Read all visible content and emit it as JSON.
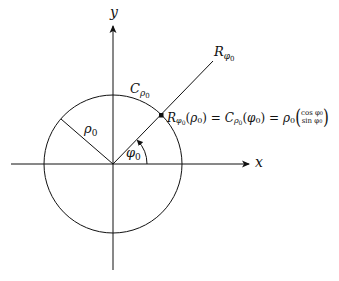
{
  "diagram": {
    "axes": {
      "x_label": "x",
      "y_label": "y"
    },
    "labels": {
      "ray": {
        "main": "R",
        "sub": "φ",
        "subsub": "0"
      },
      "circle": {
        "main": "C",
        "sub": "ρ",
        "subsub": "0"
      },
      "radius": {
        "main": "ρ",
        "sub": "0"
      },
      "angle": {
        "main": "φ",
        "sub": "0"
      },
      "equation": {
        "lhs_main": "R",
        "lhs_sub": "φ",
        "lhs_subsub": "0",
        "lhs_arg_open": "(",
        "lhs_arg": "ρ",
        "lhs_arg_sub": "0",
        "lhs_arg_close": ")",
        "eq1": " = ",
        "mid_main": "C",
        "mid_sub": "ρ",
        "mid_subsub": "0",
        "mid_arg_open": "(",
        "mid_arg": "φ",
        "mid_arg_sub": "0",
        "mid_arg_close": ")",
        "eq2": " = ",
        "rhs_main": "ρ",
        "rhs_sub": "0",
        "vec_top": "cos φ",
        "vec_top_sub": "0",
        "vec_bottom": "sin φ",
        "vec_bottom_sub": "0"
      }
    },
    "geometry": {
      "origin": [
        113,
        164
      ],
      "radius": 69,
      "angle_deg": 45,
      "stroke_color": "#111111",
      "background": "#ffffff"
    }
  }
}
